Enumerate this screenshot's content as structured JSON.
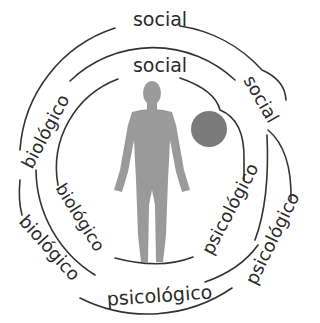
{
  "diagram": {
    "type": "biopsychosocial concentric model",
    "colors": {
      "line": "#333333",
      "text": "#2a2a2a",
      "figure": "#9a9a9a",
      "circle": "#7a7a7a",
      "background": "#ffffff"
    },
    "outer_ring": {
      "top_label": "social",
      "left_label": "biológico",
      "lower_left_label": "biológico",
      "bottom_label": "psicológico",
      "right_label": "psicológico"
    },
    "middle_ring": {
      "right_upper_label": "social",
      "right_label": "psicológico"
    },
    "inner_ring": {
      "top_label": "social",
      "left_label": "biológico"
    },
    "center": {
      "figure": "human-figure",
      "circle": "gray-circle"
    }
  }
}
